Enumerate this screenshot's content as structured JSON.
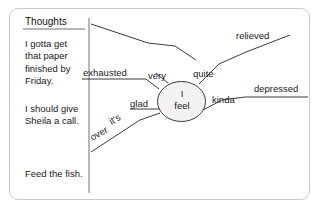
{
  "diagram": {
    "column_header": "Thoughts",
    "thoughts": [
      "I gotta get that paper finished by Friday.",
      "I should give Sheila a call.",
      "Feed the fish."
    ],
    "center_line1": "I",
    "center_line2": "feel",
    "branches": {
      "relieved": "relieved",
      "quite": "quite",
      "depressed": "depressed",
      "kinda": "kinda",
      "exhausted": "exhausted",
      "very": "very",
      "glad": "glad",
      "its": "it's",
      "over": "over"
    },
    "colors": {
      "frame_border": "#c9c9c9",
      "line": "#3a3a3a",
      "text": "#1a1a1a",
      "ellipse_fill": "#f2f2f2"
    }
  }
}
